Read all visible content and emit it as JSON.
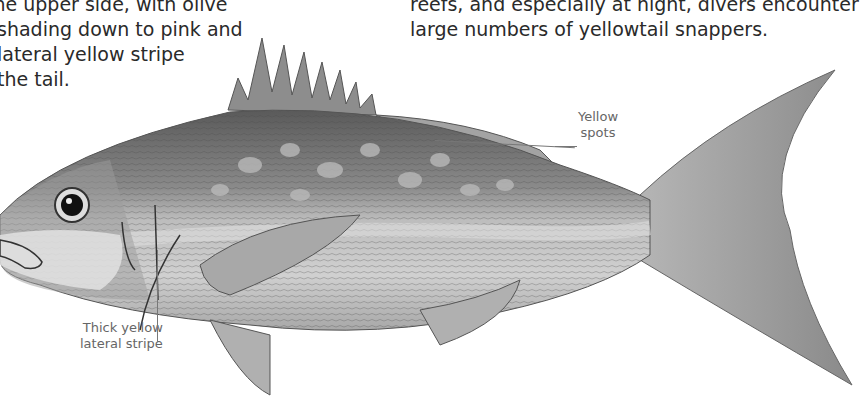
{
  "left_text": {
    "lines": [
      "the upper side, with olive",
      "shading down to pink and",
      "lateral yellow stripe",
      "the tail."
    ]
  },
  "right_text": {
    "lines": [
      "reefs, and especially at night, divers encounter",
      "large numbers of yellowtail snappers."
    ]
  },
  "illustration": {
    "subject": "yellowtail snapper fish illustration",
    "labels": {
      "spots_line1": "Yellow",
      "spots_line2": "spots",
      "stripe_line1": "Thick yellow",
      "stripe_line2": "lateral stripe"
    }
  }
}
